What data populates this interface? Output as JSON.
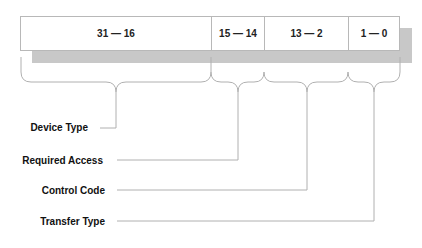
{
  "diagram": {
    "fields": [
      {
        "bits": "31 — 16",
        "label": "Device Type"
      },
      {
        "bits": "15 — 14",
        "label": "Required Access"
      },
      {
        "bits": "13 — 2",
        "label": "Control Code"
      },
      {
        "bits": "1 — 0",
        "label": "Transfer Type"
      }
    ],
    "colors": {
      "shadow": "#c8c8c8",
      "line": "#b0b0b0",
      "text": "#111111"
    }
  }
}
